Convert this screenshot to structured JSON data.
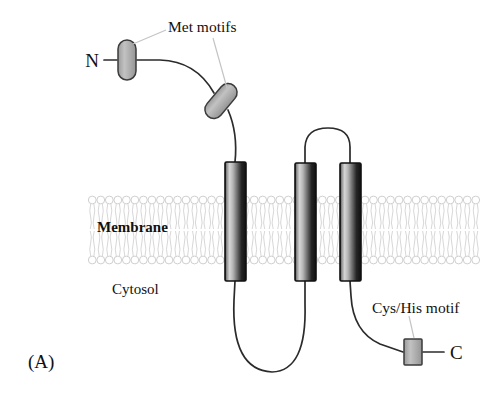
{
  "figure": {
    "panel_label": "(A)",
    "type": "membrane-protein-topology-diagram",
    "background_color": "#ffffff"
  },
  "labels": {
    "n_terminus": "N",
    "c_terminus": "C",
    "met_motifs": "Met motifs",
    "cys_his_motif": "Cys/His motif",
    "membrane": "Membrane",
    "cytosol": "Cytosol"
  },
  "colors": {
    "outline": "#1a1a1a",
    "chain_stroke": "#2b2b2b",
    "motif_fill": "#b0b0b0",
    "motif_stroke": "#3a3a3a",
    "helix_dark": "#141414",
    "helix_light": "#d8d8d8",
    "helix_stroke": "#111111",
    "membrane_lipid": "#cfcfcf",
    "leader_line": "#c8c8c8"
  },
  "membrane": {
    "label": "Membrane",
    "x": 88,
    "y": 192,
    "width": 392,
    "height": 76,
    "leaflets": 2,
    "lipid_count": 46
  },
  "helices": [
    {
      "name": "helix-1",
      "x": 225,
      "y": 162,
      "width": 21,
      "height": 119
    },
    {
      "name": "helix-2",
      "x": 295,
      "y": 163,
      "width": 21,
      "height": 118
    },
    {
      "name": "helix-3",
      "x": 340,
      "y": 163,
      "width": 21,
      "height": 118
    }
  ],
  "motifs": [
    {
      "name": "met-motif-1",
      "shape": "capsule",
      "cx": 127,
      "cy": 60,
      "rotation": 0
    },
    {
      "name": "met-motif-2",
      "shape": "capsule",
      "cx": 221,
      "cy": 101,
      "rotation": 40
    },
    {
      "name": "cys-his-motif",
      "shape": "rectangle",
      "cx": 413,
      "cy": 352,
      "rotation": 0
    }
  ],
  "annotations": [
    {
      "name": "met-motifs-annotation",
      "text": "Met motifs",
      "x": 168,
      "y": 32
    },
    {
      "name": "cys-his-annotation",
      "text": "Cys/His motif",
      "x": 372,
      "y": 308
    }
  ]
}
